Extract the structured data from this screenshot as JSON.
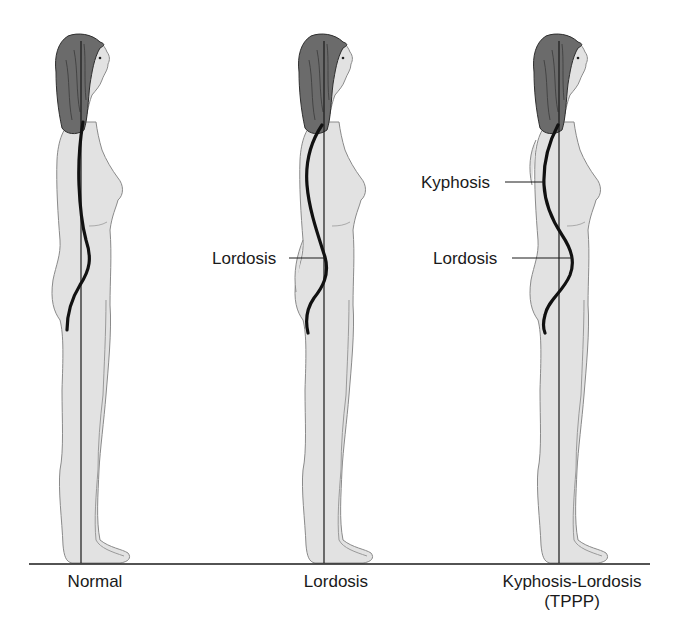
{
  "diagram": {
    "type": "posture-comparison",
    "colors": {
      "background": "#ffffff",
      "body_fill": "#e2e2e2",
      "body_outline": "#8a8a8a",
      "hair_fill": "#6b6b6b",
      "hair_outline": "#2e2e2e",
      "spine": "#111111",
      "plumb_line": "#1a1a1a",
      "baseline": "#1a1a1a",
      "text": "#1a1a1a"
    },
    "baseline": {
      "x1": 29,
      "x2": 650,
      "y": 564
    },
    "figures": [
      {
        "id": "normal",
        "caption": "Normal",
        "caption_x": 95,
        "plumb_x": 81,
        "dx": 0,
        "spine": "M83,122 C80,140 78,160 79,185 C80,210 82,225 86,240 C92,258 90,270 80,285 C72,298 67,312 67,330",
        "callouts": []
      },
      {
        "id": "lordosis",
        "caption": "Lordosis",
        "caption_x": 336,
        "plumb_x": 324,
        "dx": 242,
        "spine": "M322,125 C312,140 305,160 307,185 C309,210 318,235 325,257 C330,275 322,288 314,298 C307,308 305,320 308,333",
        "callouts": [
          {
            "label": "Lordosis",
            "text_x": 212,
            "text_y": 250,
            "line_x1": 289,
            "line_x2": 325,
            "line_y": 258
          }
        ]
      },
      {
        "id": "kyphosis-lordosis",
        "caption": "Kyphosis-Lordosis",
        "caption_sub": "(TPPP)",
        "caption_x": 572,
        "plumb_x": 559,
        "dx": 477,
        "spine": "M558,125 C550,140 543,160 544,185 C545,205 552,220 562,235 C572,250 575,262 570,275 C563,292 548,300 545,315 C543,322 543,328 545,333",
        "callouts": [
          {
            "label": "Kyphosis",
            "text_x": 421,
            "text_y": 174,
            "line_x1": 505,
            "line_x2": 544,
            "line_y": 182
          },
          {
            "label": "Lordosis",
            "text_x": 433,
            "text_y": 250,
            "line_x1": 512,
            "line_x2": 573,
            "line_y": 258
          }
        ]
      }
    ]
  }
}
